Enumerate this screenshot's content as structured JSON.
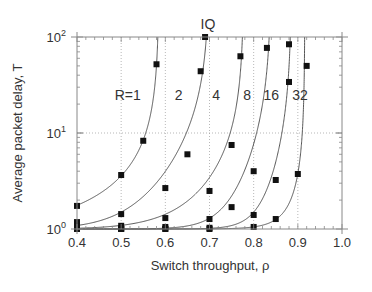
{
  "chart_data": {
    "type": "line",
    "title": "IQ",
    "xlabel": "Switch throughput, ρ",
    "ylabel": "Average packet delay, T",
    "xlim": [
      0.4,
      1.0
    ],
    "ylim": [
      1,
      100
    ],
    "yscale": "log",
    "grid": true,
    "x_ticks": [
      0.4,
      0.5,
      0.6,
      0.7,
      0.8,
      0.9,
      1.0
    ],
    "x_tick_labels": [
      "0.4",
      "0.5",
      "0.6",
      "0.7",
      "0.8",
      "0.9",
      "1.0"
    ],
    "y_ticks": [
      1,
      10,
      100
    ],
    "y_tick_labels": [
      {
        "base": "10",
        "exp": "0"
      },
      {
        "base": "10",
        "exp": "1"
      },
      {
        "base": "10",
        "exp": "2"
      }
    ],
    "vertical_gridlines": [
      0.5,
      0.6,
      0.7,
      0.8,
      0.9
    ],
    "horizontal_gridlines": [
      10
    ],
    "series": [
      {
        "name": "R=1",
        "label": "R=1",
        "label_pos": [
          0.515,
          25
        ],
        "asymptote": 0.586,
        "points": [
          [
            0.4,
            1.74
          ],
          [
            0.5,
            3.65
          ],
          [
            0.55,
            8.3
          ],
          [
            0.58,
            52
          ]
        ]
      },
      {
        "name": "R=2",
        "label": "2",
        "label_pos": [
          0.63,
          25
        ],
        "asymptote": 0.7,
        "points": [
          [
            0.4,
            1.18
          ],
          [
            0.5,
            1.43
          ],
          [
            0.6,
            2.67
          ],
          [
            0.65,
            6.0
          ],
          [
            0.68,
            44
          ],
          [
            0.69,
            100
          ]
        ]
      },
      {
        "name": "R=4",
        "label": "4",
        "label_pos": [
          0.715,
          25
        ],
        "asymptote": 0.778,
        "points": [
          [
            0.4,
            1.05
          ],
          [
            0.5,
            1.08
          ],
          [
            0.6,
            1.3
          ],
          [
            0.7,
            2.49
          ],
          [
            0.75,
            7.5
          ],
          [
            0.77,
            63
          ]
        ]
      },
      {
        "name": "R=8",
        "label": "8",
        "label_pos": [
          0.785,
          25
        ],
        "asymptote": 0.84,
        "points": [
          [
            0.4,
            1.0
          ],
          [
            0.5,
            1.02
          ],
          [
            0.6,
            1.05
          ],
          [
            0.7,
            1.27
          ],
          [
            0.75,
            1.69
          ],
          [
            0.8,
            4.0
          ],
          [
            0.83,
            77
          ]
        ]
      },
      {
        "name": "R=16",
        "label": "16",
        "label_pos": [
          0.84,
          25
        ],
        "asymptote": 0.886,
        "points": [
          [
            0.4,
            1.0
          ],
          [
            0.5,
            1.0
          ],
          [
            0.6,
            1.01
          ],
          [
            0.7,
            1.03
          ],
          [
            0.8,
            1.4
          ],
          [
            0.85,
            3.24
          ],
          [
            0.88,
            34
          ],
          [
            0.88,
            84
          ]
        ]
      },
      {
        "name": "R=32",
        "label": "32",
        "label_pos": [
          0.905,
          25
        ],
        "asymptote": 0.916,
        "points": [
          [
            0.4,
            1.0
          ],
          [
            0.5,
            1.0
          ],
          [
            0.6,
            1.0
          ],
          [
            0.7,
            1.0
          ],
          [
            0.8,
            1.05
          ],
          [
            0.85,
            1.27
          ],
          [
            0.9,
            3.74
          ],
          [
            0.92,
            50
          ]
        ]
      }
    ]
  },
  "colors": {
    "axis": "#888888",
    "grid": "#999999",
    "curve": "#444444",
    "marker": "#111111",
    "text": "#333333"
  }
}
